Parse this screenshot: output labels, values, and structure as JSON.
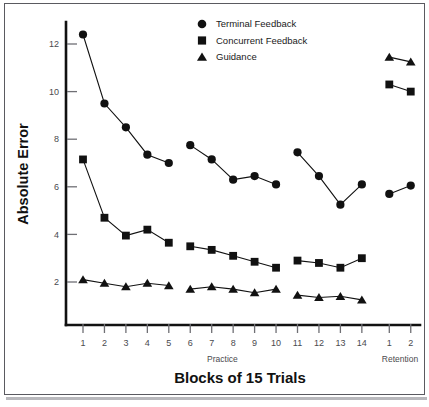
{
  "chart_data": {
    "type": "line",
    "title": "",
    "xlabel": "Blocks of 15 Trials",
    "ylabel": "Absolute Error",
    "ylim": [
      0,
      13
    ],
    "yticks": [
      2,
      4,
      6,
      8,
      10,
      12
    ],
    "ytick_labels": [
      "2",
      "4",
      "6",
      "8",
      "10",
      "12"
    ],
    "grid": false,
    "legend_position": "top-center",
    "x_categories": [
      "1",
      "2",
      "3",
      "4",
      "5",
      "6",
      "7",
      "8",
      "9",
      "10",
      "11",
      "12",
      "13",
      "14",
      "1",
      "2"
    ],
    "phase_labels": [
      {
        "label": "Practice",
        "spans_blocks": "1-14"
      },
      {
        "label": "Retention",
        "spans_blocks": "1-2"
      }
    ],
    "segments": [
      {
        "name": "practice-1-5",
        "x_indices": [
          0,
          1,
          2,
          3,
          4
        ]
      },
      {
        "name": "practice-6-10",
        "x_indices": [
          5,
          6,
          7,
          8,
          9
        ]
      },
      {
        "name": "practice-11-14",
        "x_indices": [
          10,
          11,
          12,
          13
        ]
      },
      {
        "name": "retention-1-2",
        "x_indices": [
          14,
          15
        ]
      }
    ],
    "series": [
      {
        "name": "Terminal Feedback",
        "marker": "circle",
        "color": "#111111",
        "values": [
          12.4,
          9.5,
          8.5,
          7.35,
          7.0,
          7.75,
          7.15,
          6.3,
          6.45,
          6.1,
          7.45,
          6.45,
          5.25,
          6.1,
          5.7,
          6.05
        ]
      },
      {
        "name": "Concurrent Feedback",
        "marker": "square",
        "color": "#111111",
        "values": [
          7.15,
          4.7,
          3.95,
          4.2,
          3.65,
          3.5,
          3.35,
          3.1,
          2.85,
          2.6,
          2.9,
          2.8,
          2.6,
          3.0,
          10.3,
          10.0
        ]
      },
      {
        "name": "Guidance",
        "marker": "triangle",
        "color": "#111111",
        "values": [
          2.1,
          1.95,
          1.8,
          1.95,
          1.85,
          1.7,
          1.8,
          1.7,
          1.55,
          1.7,
          1.45,
          1.35,
          1.4,
          1.25,
          11.45,
          11.25
        ]
      }
    ]
  },
  "legend": {
    "items": [
      {
        "label": "Terminal Feedback",
        "marker": "circle"
      },
      {
        "label": "Concurrent Feedback",
        "marker": "square"
      },
      {
        "label": "Guidance",
        "marker": "triangle"
      }
    ]
  },
  "axes": {
    "y_title": "Absolute Error",
    "x_title": "Blocks of 15 Trials"
  }
}
